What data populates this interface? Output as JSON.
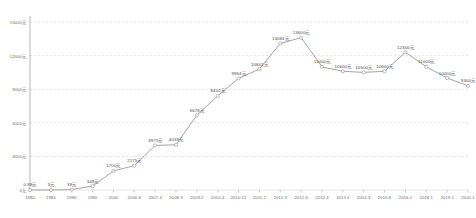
{
  "chart_data": {
    "type": "line",
    "title": "",
    "xlabel": "",
    "ylabel": "",
    "ylim": [
      0,
      15000
    ],
    "grid": true,
    "legend": "none",
    "y_ticks": [
      "15000元",
      "12000元",
      "9000元",
      "6000元",
      "3000元",
      "0元"
    ],
    "y_tick_values": [
      15000,
      12000,
      9000,
      6000,
      3000,
      0
    ],
    "categories": [
      "1980",
      "1984",
      "1986",
      "1990",
      "2000",
      "2006.8",
      "2007.4",
      "2008.3",
      "2009.2",
      "2010.4",
      "2010.12",
      "2011.2",
      "2011.3",
      "2012.6",
      "2012.4",
      "2013.4",
      "2014.3",
      "2015.8",
      "2016.1",
      "2018.1",
      "2019.1",
      "2020.1"
    ],
    "values": [
      0.88,
      3,
      38,
      348,
      1700,
      2175,
      3975,
      4039,
      6678,
      8402,
      9964,
      10802,
      13084,
      13600,
      11000,
      10600,
      10500,
      10600,
      12300,
      11000,
      10000,
      9300
    ],
    "point_labels": [
      "0.88元",
      "3元",
      "38元",
      "348元",
      "1700元",
      "2175元",
      "3975元",
      "4039元",
      "6678元",
      "8402元",
      "9964元",
      "10802元",
      "13084元",
      "13600元",
      "11000元",
      "10600元",
      "10500元",
      "10600元",
      "12300元",
      "11000元",
      "10000元",
      "9300元"
    ],
    "line_color": "#9a9a9a",
    "marker_color": "#ffffff",
    "marker_edge_color": "#8c8c8c",
    "grid_color": "#c9c9c9",
    "axis_color": "#9a9a9a",
    "text_color": "#6b6b6b"
  }
}
